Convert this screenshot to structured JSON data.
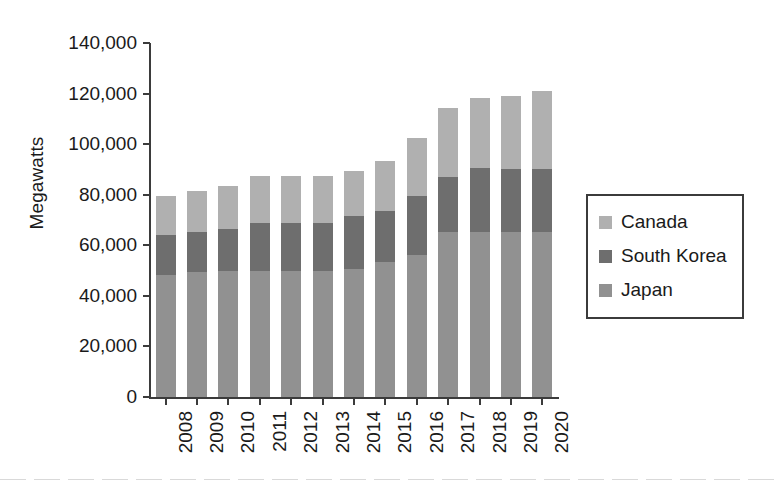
{
  "chart_data": {
    "type": "bar",
    "stacked": true,
    "title": "",
    "xlabel": "",
    "ylabel": "Megawatts",
    "ylim": [
      0,
      140000
    ],
    "ytick_step": 20000,
    "ytick_labels": [
      "140,000",
      "120,000",
      "100,000",
      "80,000",
      "60,000",
      "40,000",
      "20,000",
      "0"
    ],
    "ytick_values": [
      140000,
      120000,
      100000,
      80000,
      60000,
      40000,
      20000,
      0
    ],
    "grid": false,
    "legend_position": "right",
    "categories": [
      "2008",
      "2009",
      "2010",
      "2011",
      "2012",
      "2013",
      "2014",
      "2015",
      "2016",
      "2017",
      "2018",
      "2019",
      "2020"
    ],
    "series": [
      {
        "name": "Japan",
        "color": "#919191",
        "values": [
          48200,
          49400,
          49800,
          49800,
          49800,
          49800,
          50800,
          53400,
          56100,
          65200,
          65200,
          65200,
          65200
        ]
      },
      {
        "name": "South Korea",
        "color": "#6e6e6e",
        "values": [
          15800,
          15800,
          16600,
          19200,
          19200,
          19200,
          20600,
          20200,
          23300,
          21800,
          25300,
          24800,
          24800
        ]
      },
      {
        "name": "Canada",
        "color": "#b0b0b0",
        "values": [
          15600,
          16300,
          17000,
          18300,
          18300,
          18300,
          17900,
          19700,
          23000,
          27200,
          27700,
          28900,
          31000
        ]
      }
    ],
    "totals": [
      79600,
      81500,
      83400,
      87300,
      87300,
      87300,
      89300,
      93300,
      102400,
      114200,
      118200,
      118900,
      121000
    ]
  },
  "legend": {
    "entries": [
      {
        "label": "Canada",
        "color": "#b0b0b0"
      },
      {
        "label": "South Korea",
        "color": "#6e6e6e"
      },
      {
        "label": "Japan",
        "color": "#919191"
      }
    ]
  }
}
